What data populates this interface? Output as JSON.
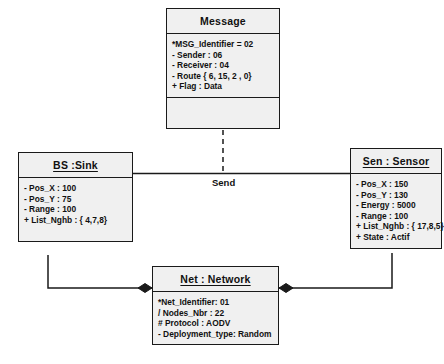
{
  "diagram": {
    "type": "uml-class-diagram",
    "background_color": "#ffffff",
    "box_fill_color": "#f0f0f0",
    "line_color": "#1a1a1a",
    "classes": [
      {
        "id": "message",
        "name": "Message",
        "is_instance": false,
        "attributes": [
          "*MSG_Identifier = 02",
          "- Sender : 06",
          "- Receiver : 04",
          "- Route { 6, 15, 2 , 0}",
          "+ Flag : Data"
        ],
        "operations": []
      },
      {
        "id": "sink",
        "name": "BS :Sink",
        "is_instance": true,
        "attributes": [
          "- Pos_X : 100",
          "- Pos_Y : 75",
          "- Range : 100",
          "+ List_Nghb : { 4,7,8}"
        ]
      },
      {
        "id": "sensor",
        "name": "Sen : Sensor",
        "is_instance": true,
        "attributes": [
          "- Pos_X : 150",
          "- Pos_Y : 130",
          "- Energy : 5000",
          "- Range : 100",
          "+ List_Nghb : { 17,8,5}",
          "+ State : Actif"
        ]
      },
      {
        "id": "network",
        "name": "Net : Network",
        "is_instance": true,
        "attributes": [
          "*Net_Identifier: 01",
          "/ Nodes_Nbr : 22",
          "# Protocol : AODV",
          "- Deployment_type: Random"
        ]
      }
    ],
    "associations": [
      {
        "id": "send",
        "label": "Send",
        "from": "sink",
        "to": "sensor",
        "style": "solid"
      },
      {
        "id": "message-link",
        "label": "",
        "from": "message",
        "to": "send",
        "style": "dashed"
      },
      {
        "id": "sink-network",
        "label": "",
        "from": "sink",
        "to": "network",
        "style": "composition"
      },
      {
        "id": "sensor-network",
        "label": "",
        "from": "sensor",
        "to": "network",
        "style": "composition"
      }
    ]
  }
}
